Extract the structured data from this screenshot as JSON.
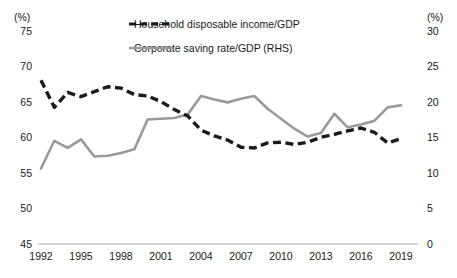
{
  "axes": {
    "left_unit_label": "(%)",
    "right_unit_label": "(%)",
    "left_ticks": [
      "75",
      "70",
      "65",
      "60",
      "55",
      "50",
      "45"
    ],
    "right_ticks": [
      "30",
      "25",
      "20",
      "15",
      "10",
      "5",
      "0"
    ],
    "x_ticks": [
      "1992",
      "1995",
      "1998",
      "2001",
      "2004",
      "2007",
      "2010",
      "2013",
      "2016",
      "2019"
    ]
  },
  "legend": {
    "items": [
      {
        "label": "Household disposable income/GDP",
        "style": "dashed",
        "color": "#1a1a1a"
      },
      {
        "label": "Corporate saving rate/GDP (RHS)",
        "style": "solid",
        "color": "#9a9a9a"
      }
    ]
  },
  "colors": {
    "household_line": "#1a1a1a",
    "corporate_line": "#9a9a9a",
    "axis": "#bdbdbd",
    "text": "#1a1a1a",
    "background": "#ffffff"
  },
  "chart_data": {
    "type": "line",
    "title": "",
    "xlabel": "",
    "ylabel": "(%)",
    "y2label": "(%)",
    "ylim": [
      45,
      75
    ],
    "y2lim": [
      0,
      30
    ],
    "xlim": [
      1992,
      2019
    ],
    "grid": false,
    "legend_position": "top-center",
    "x": [
      1992,
      1993,
      1994,
      1995,
      1996,
      1997,
      1998,
      1999,
      2000,
      2001,
      2002,
      2003,
      2004,
      2005,
      2006,
      2007,
      2008,
      2009,
      2010,
      2011,
      2012,
      2013,
      2014,
      2015,
      2016,
      2017,
      2018,
      2019
    ],
    "series": [
      {
        "name": "Household disposable income/GDP",
        "axis": "left",
        "style": "dashed",
        "color": "#1a1a1a",
        "values": [
          68.0,
          64.2,
          66.3,
          65.7,
          66.4,
          67.1,
          66.9,
          66.0,
          65.8,
          65.0,
          63.9,
          63.0,
          61.0,
          60.2,
          59.6,
          58.6,
          58.5,
          59.2,
          59.3,
          59.0,
          59.3,
          60.0,
          60.4,
          60.9,
          61.3,
          60.7,
          59.2,
          59.8
        ]
      },
      {
        "name": "Corporate saving rate/GDP (RHS)",
        "axis": "right",
        "style": "solid",
        "color": "#9a9a9a",
        "values": [
          10.6,
          14.5,
          13.5,
          14.7,
          12.3,
          12.4,
          12.8,
          13.3,
          17.5,
          17.6,
          17.7,
          18.2,
          20.8,
          20.3,
          19.9,
          20.4,
          20.8,
          19.0,
          17.6,
          16.2,
          15.1,
          15.6,
          18.3,
          16.4,
          16.8,
          17.3,
          19.2,
          19.5
        ]
      }
    ]
  }
}
